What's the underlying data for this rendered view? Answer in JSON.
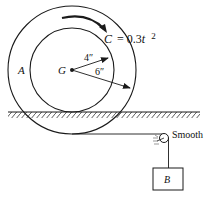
{
  "diagram": {
    "wheel_label": "A",
    "center_label": "G",
    "inner_radius_label": "4″",
    "outer_radius_label": "6″",
    "couple_label_prefix": "C",
    "couple_label_eq": "= 0.3",
    "couple_label_var": "t",
    "couple_label_exp": "2",
    "pulley_label": "Smooth",
    "block_label": "B"
  },
  "colors": {
    "stroke": "#1a1a1a",
    "background": "#ffffff"
  }
}
